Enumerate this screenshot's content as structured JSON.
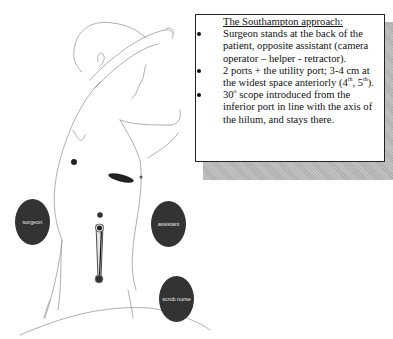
{
  "figure": {
    "type": "thoracoscopic surgery setup diagram (patient in lateral position, viewed from back)",
    "ports": [
      {
        "name": "upper-port",
        "shape": "dot"
      },
      {
        "name": "utility-port",
        "shape": "elongated incision"
      },
      {
        "name": "camera-port-upper",
        "shape": "dot"
      },
      {
        "name": "inferior-port",
        "shape": "dot with scope"
      }
    ],
    "colors": {
      "role_fill": "#333333",
      "role_text": "#e8e8e8",
      "outline": "#9a9a9a",
      "textbox_border": "#222222",
      "shadow": "#b8b8b8"
    }
  },
  "roles": {
    "surgeon": "surgeon",
    "assistant": "assistant",
    "scrub_nurse": "scrub nurse"
  },
  "textbox": {
    "title": "The Southampton approach:",
    "bullets": [
      {
        "text": "Surgeon stands at the back of the patient, opposite assistant (camera operator – helper - retractor)."
      },
      {
        "pre": "2 ports + the utility port; 3-4 cm at the widest space anteriorly (4",
        "sup1": "th",
        "mid": ", 5",
        "sup2": "th",
        "post": ")."
      },
      {
        "pre": "30",
        "sup1": "o",
        "post": " scope introduced from the inferior port in line with the axis of the hilum, and stays there."
      }
    ]
  }
}
